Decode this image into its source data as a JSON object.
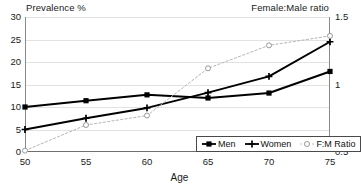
{
  "chart_data": {
    "type": "line",
    "title": "",
    "xlabel": "Age",
    "ylabel": "Prevalence %",
    "y2label": "Female:Male ratio",
    "categories": [
      "50",
      "55",
      "60",
      "65",
      "70",
      "75"
    ],
    "x": [
      50,
      55,
      60,
      65,
      70,
      75
    ],
    "xlim": [
      50,
      75
    ],
    "ylim": [
      0,
      30
    ],
    "y2lim": [
      0.5,
      1.5
    ],
    "yticks": [
      "0",
      "5",
      "10",
      "15",
      "20",
      "25",
      "30"
    ],
    "ytick_values": [
      0,
      5,
      10,
      15,
      20,
      25,
      30
    ],
    "y2ticks": [
      "0.5",
      "1",
      "1.5"
    ],
    "y2tick_values": [
      0.5,
      1,
      1.5
    ],
    "xticks": [
      "50",
      "55",
      "60",
      "65",
      "70",
      "75"
    ],
    "grid": "horizontal",
    "legend_position": "bottom-right",
    "series": [
      {
        "name": "Men",
        "axis": "left",
        "marker": "filled-square",
        "color": "#000000",
        "values": [
          10.0,
          11.4,
          12.7,
          12.0,
          13.1,
          17.9
        ]
      },
      {
        "name": "Women",
        "axis": "left",
        "marker": "plus",
        "color": "#000000",
        "values": [
          5.0,
          7.5,
          9.8,
          13.2,
          16.8,
          24.5
        ]
      },
      {
        "name": "F:M Ratio",
        "axis": "right",
        "marker": "open-circle",
        "color": "#b5b5b5",
        "values": [
          0.51,
          0.7,
          0.77,
          1.12,
          1.29,
          1.36
        ]
      }
    ]
  },
  "legend": {
    "items": [
      {
        "label": "Men",
        "marker": "filled-square-icon"
      },
      {
        "label": "Women",
        "marker": "plus-marker-icon"
      },
      {
        "label": "F:M Ratio",
        "marker": "open-circle-icon"
      }
    ]
  },
  "colors": {
    "series_primary": "#000000",
    "series_ratio": "#b5b5b5",
    "gridline": "#e2e2e2",
    "axis": "#8a8a8a",
    "text": "#1a1a1a",
    "background": "#ffffff"
  }
}
